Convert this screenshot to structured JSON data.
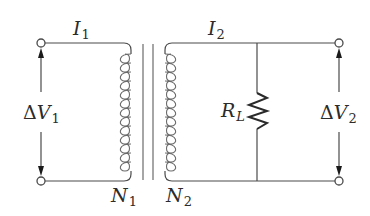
{
  "diagram": {
    "labels": {
      "I1": {
        "symbol": "I",
        "sub": "1"
      },
      "I2": {
        "symbol": "I",
        "sub": "2"
      },
      "dV1": {
        "delta": "Δ",
        "symbol": "V",
        "sub": "1"
      },
      "dV2": {
        "delta": "Δ",
        "symbol": "V",
        "sub": "2"
      },
      "N1": {
        "symbol": "N",
        "sub": "1"
      },
      "N2": {
        "symbol": "N",
        "sub": "2"
      },
      "RL": {
        "symbol": "R",
        "sub": "L"
      }
    },
    "components": {
      "primary_coil_turns_drawn": 13,
      "secondary_coil_turns_drawn": 13,
      "core_lines": 2,
      "terminals": 4
    },
    "colors": {
      "wire": "#4a4a4a",
      "coil": "#6b6b6b",
      "resistor": "#2a2a2a",
      "text": "#2b2b2b",
      "background": "#ffffff"
    }
  }
}
